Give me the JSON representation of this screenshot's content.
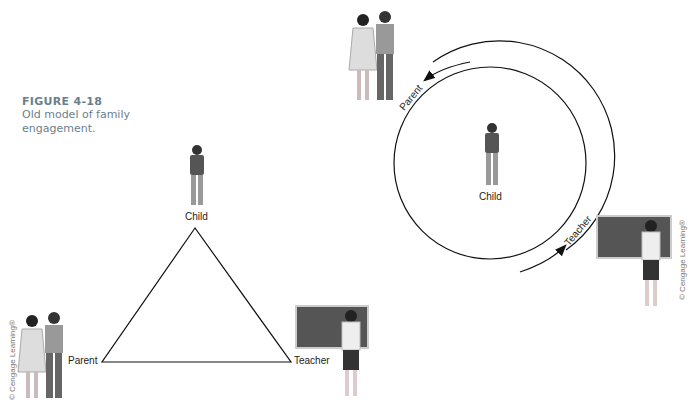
{
  "caption": {
    "figure_label": "FIGURE 4-18",
    "description": "Old model of family engagement."
  },
  "triangle_diagram": {
    "labels": {
      "top": "Child",
      "left": "Parent",
      "right": "Teacher"
    }
  },
  "circle_diagram": {
    "labels": {
      "center": "Child",
      "arc_top": "Parent",
      "arc_bottom": "Teacher"
    }
  },
  "credits": {
    "left": "© Cengage Learning®",
    "right": "© Cengage Learning®"
  }
}
